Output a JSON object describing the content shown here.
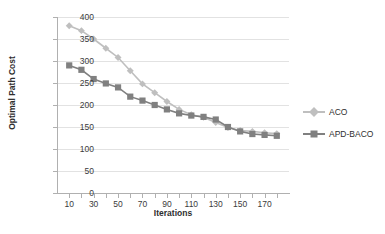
{
  "chart_data": {
    "type": "line",
    "title": "",
    "xlabel": "Iterations",
    "ylabel": "Optimal Path Cost",
    "x": [
      10,
      20,
      30,
      40,
      50,
      60,
      70,
      80,
      90,
      100,
      110,
      120,
      130,
      140,
      150,
      160,
      170,
      180
    ],
    "xlim": [
      0,
      190
    ],
    "ylim": [
      0,
      400
    ],
    "yticks": [
      0,
      50,
      100,
      150,
      200,
      250,
      300,
      350,
      400
    ],
    "xticks": [
      10,
      20,
      30,
      40,
      50,
      60,
      70,
      80,
      90,
      100,
      110,
      120,
      130,
      140,
      150,
      160,
      170,
      180
    ],
    "xtick_labels_shown": [
      10,
      30,
      50,
      70,
      90,
      110,
      130,
      150,
      170
    ],
    "grid": "horizontal",
    "legend_position": "right",
    "series": [
      {
        "name": "ACO",
        "color": "#bfbfbf",
        "marker": "diamond",
        "values": [
          380,
          369,
          350,
          329,
          308,
          278,
          248,
          228,
          208,
          190,
          178,
          172,
          160,
          149,
          142,
          140,
          137,
          135
        ]
      },
      {
        "name": "APD-BACO",
        "color": "#808080",
        "marker": "square",
        "values": [
          290,
          280,
          259,
          249,
          240,
          219,
          210,
          200,
          190,
          181,
          176,
          173,
          167,
          150,
          140,
          134,
          132,
          130
        ]
      }
    ]
  },
  "legend": {
    "items": [
      {
        "label": "ACO"
      },
      {
        "label": "APD-BACO"
      }
    ]
  },
  "axes": {
    "y_title": "Optimal Path Cost",
    "x_title": "Iterations",
    "y_tick_labels": [
      "0",
      "50",
      "100",
      "150",
      "200",
      "250",
      "300",
      "350",
      "400"
    ],
    "x_tick_labels": [
      "10",
      "30",
      "50",
      "70",
      "90",
      "110",
      "130",
      "150",
      "170"
    ]
  },
  "colors": {
    "aco": "#bfbfbf",
    "apd_baco": "#808080",
    "grid": "#e2e2e2",
    "axis": "#b0b0b0",
    "text": "#3b3b3b",
    "background": "#ffffff"
  }
}
